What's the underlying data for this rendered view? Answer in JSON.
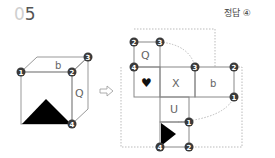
{
  "problem": {
    "number_prefix": "0",
    "number_digit": "5"
  },
  "answer": {
    "label": "정답 ④"
  },
  "cube": {
    "top_face_label": "b",
    "right_face_label": "Q",
    "front_face_shape": "black-triangle",
    "vertex_markers": [
      "1",
      "2",
      "3",
      "4"
    ]
  },
  "arrow": {
    "direction": "right",
    "symbol": "⇨"
  },
  "net": {
    "face_labels": {
      "top": "Q",
      "middle_left": "♥",
      "middle_center": "X",
      "middle_right": "b",
      "lower": "U"
    },
    "bottom_face_shape": "black-triangle-pointing-right",
    "vertex_markers": [
      "2",
      "3",
      "4",
      "3",
      "2",
      "1",
      "1",
      "4",
      "2"
    ]
  },
  "colors": {
    "marker_fill": "#3a3a3a",
    "line": "#888888",
    "dashed": "#aaaaaa",
    "shape": "#000000"
  }
}
